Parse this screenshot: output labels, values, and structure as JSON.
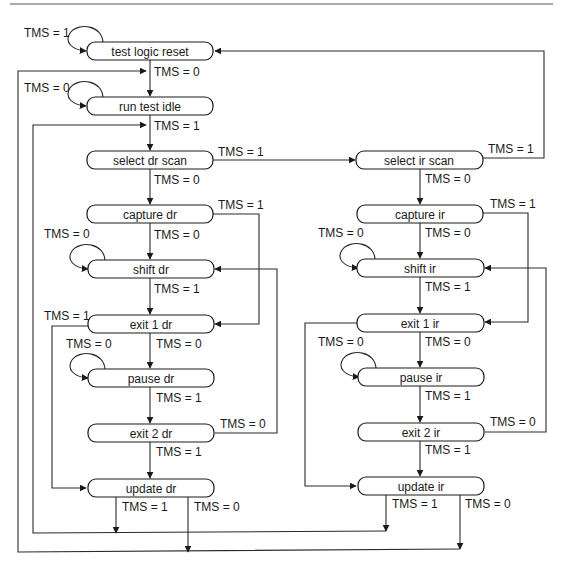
{
  "diagram": {
    "states": {
      "tlr": "test logic reset",
      "rti": "run test idle",
      "sdr": "select dr scan",
      "cdr": "capture dr",
      "shdr": "shift dr",
      "e1dr": "exit 1 dr",
      "pdr": "pause dr",
      "e2dr": "exit 2 dr",
      "udr": "update dr",
      "sir": "select ir scan",
      "cir": "capture ir",
      "shir": "shift ir",
      "e1ir": "exit 1 ir",
      "pir": "pause ir",
      "e2ir": "exit 2 ir",
      "uir": "update ir"
    },
    "labels": {
      "tlr_self": "TMS = 1",
      "tlr_to_rti": "TMS = 0",
      "rti_self": "TMS = 0",
      "rti_to_sdr": "TMS = 1",
      "sdr_to_sir": "TMS = 1",
      "sdr_to_cdr": "TMS = 0",
      "cdr_to_e1dr": "TMS = 1",
      "cdr_to_shdr": "TMS = 0",
      "shdr_self": "TMS = 0",
      "shdr_to_e1dr": "TMS = 1",
      "e1dr_to_udr": "TMS = 1",
      "e1dr_to_pdr": "TMS = 0",
      "pdr_self": "TMS = 0",
      "pdr_to_e2dr": "TMS = 1",
      "e2dr_to_shdr": "TMS = 0",
      "e2dr_to_udr": "TMS = 1",
      "udr_to_sdr": "TMS = 1",
      "udr_to_rti": "TMS = 0",
      "sir_to_tlr": "TMS = 1",
      "sir_to_cir": "TMS = 0",
      "cir_to_e1ir": "TMS = 1",
      "cir_to_shir": "TMS = 0",
      "shir_self": "TMS = 0",
      "shir_to_e1ir": "TMS = 1",
      "e1ir_to_pir": "TMS = 0",
      "pir_self": "TMS = 0",
      "pir_to_e2ir": "TMS = 1",
      "e2ir_to_shir": "TMS = 0",
      "e2ir_to_uir": "TMS = 1",
      "uir_to_sdr": "TMS = 1",
      "uir_to_rti": "TMS = 0"
    },
    "colors": {
      "stroke": "#1a1a1a",
      "background": "#ffffff"
    }
  }
}
